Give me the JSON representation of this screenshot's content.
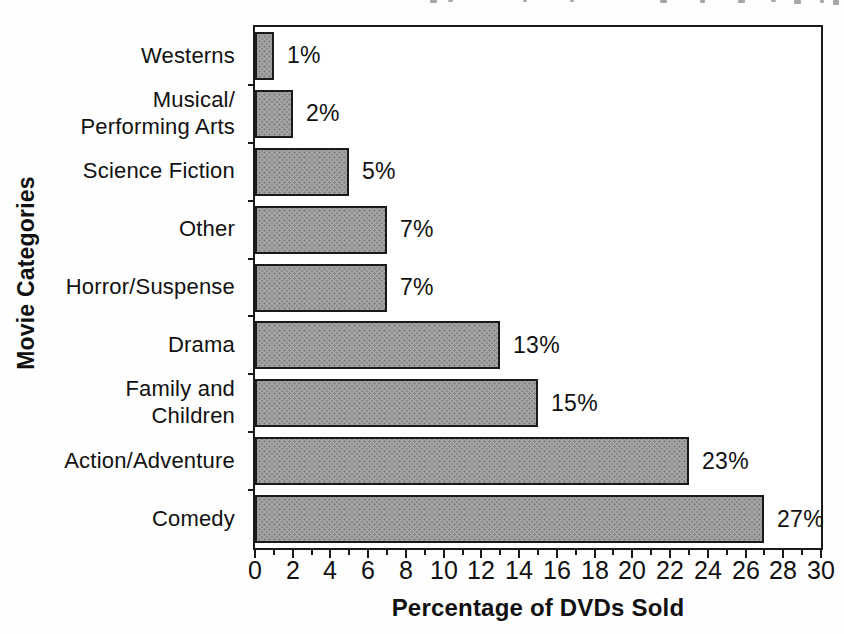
{
  "chart_data": {
    "type": "bar",
    "orientation": "horizontal",
    "title": "",
    "xlabel": "Percentage of DVDs Sold",
    "ylabel": "Movie Categories",
    "xlim": [
      0,
      30
    ],
    "x_major_tick_step": 2,
    "x_minor_tick_step": 1,
    "xtick_labels": [
      "0",
      "2",
      "4",
      "6",
      "8",
      "10",
      "12",
      "14",
      "16",
      "18",
      "20",
      "22",
      "24",
      "26",
      "28",
      "30"
    ],
    "categories_top_to_bottom": [
      "Westerns",
      "Musical/\nPerforming Arts",
      "Science Fiction",
      "Other",
      "Horror/Suspense",
      "Drama",
      "Family and\nChildren",
      "Action/Adventure",
      "Comedy"
    ],
    "values": [
      1,
      2,
      5,
      7,
      7,
      13,
      15,
      23,
      27
    ],
    "value_labels": [
      "1%",
      "2%",
      "5%",
      "7%",
      "7%",
      "13%",
      "15%",
      "23%",
      "27%"
    ],
    "grid": false,
    "frame": true,
    "legend": "none"
  },
  "colors": {
    "background": "#ffffff",
    "text": "#111111",
    "axis_and_borders": "#1a1a1a",
    "bar_fill": "#a8a8a8",
    "bar_halftone_dots": "#858585"
  }
}
